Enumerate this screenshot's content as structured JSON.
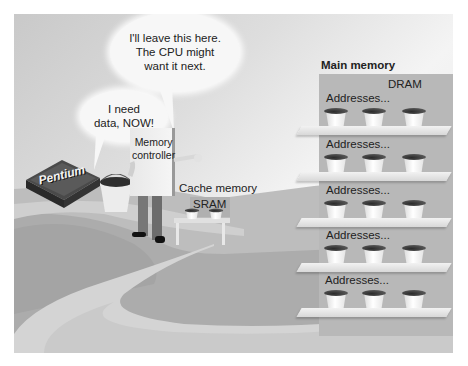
{
  "bubbles": {
    "cpu": "I need\ndata, NOW!",
    "controller": "I'll leave this here.\nThe CPU might\nwant it next."
  },
  "cpu_chip": {
    "label": "Pentium"
  },
  "memory_controller": {
    "label": "Memory\ncontroller"
  },
  "cache": {
    "title": "Cache memory",
    "type_label": "SRAM",
    "bucket_count": 2
  },
  "main_memory": {
    "title": "Main memory",
    "type_label": "DRAM",
    "shelves": [
      {
        "label": "Addresses...",
        "buckets": 3
      },
      {
        "label": "Addresses...",
        "buckets": 3
      },
      {
        "label": "Addresses...",
        "buckets": 3
      },
      {
        "label": "Addresses...",
        "buckets": 3
      },
      {
        "label": "Addresses...",
        "buckets": 3
      }
    ]
  },
  "colors": {
    "ground_dark": "#a9a9a9",
    "ground_mid": "#bdbdbd",
    "path_light": "#dadada",
    "rack": "#b8b8b8",
    "chip": "#3a3a3a"
  }
}
